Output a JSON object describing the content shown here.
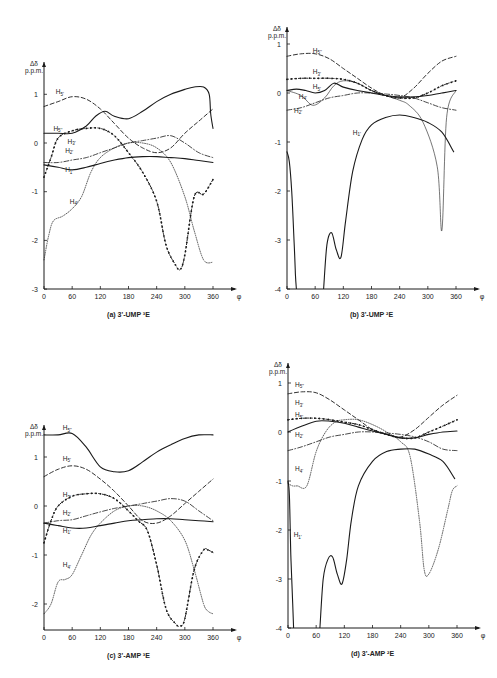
{
  "chart_data": [
    {
      "panel": "a",
      "type": "line",
      "caption": "(a)  3'-UMP ³E",
      "ylabel": "Δδ p.p.m.",
      "xlabel": "φ",
      "xlim": [
        0,
        360
      ],
      "ylim": [
        -3,
        1.3
      ],
      "xticks": [
        0,
        60,
        120,
        180,
        240,
        300,
        360
      ],
      "yticks": [
        1,
        0,
        -1,
        -2,
        -3
      ],
      "series": [
        {
          "name": "H5''",
          "style": "solid",
          "x": [
            0,
            30,
            60,
            90,
            110,
            130,
            150,
            180,
            210,
            240,
            270,
            300,
            320,
            340,
            352,
            355,
            360
          ],
          "y": [
            0.2,
            0.2,
            0.2,
            0.35,
            0.55,
            0.65,
            0.55,
            0.5,
            0.65,
            0.85,
            1.0,
            1.1,
            1.15,
            1.15,
            1.0,
            0.6,
            0.3
          ]
        },
        {
          "name": "H5'",
          "style": "dashed",
          "x": [
            0,
            30,
            60,
            90,
            120,
            150,
            180,
            210,
            240,
            270,
            300,
            330,
            360
          ],
          "y": [
            0.75,
            0.85,
            0.95,
            0.9,
            0.7,
            0.4,
            0.1,
            -0.1,
            -0.2,
            -0.1,
            0.2,
            0.45,
            0.7
          ]
        },
        {
          "name": "H3'",
          "style": "dotted-cross",
          "x": [
            0,
            15,
            30,
            60,
            90,
            120,
            150,
            180,
            210,
            240,
            260,
            280,
            290,
            300,
            320,
            340,
            360
          ],
          "y": [
            -0.7,
            -0.3,
            0.1,
            0.25,
            0.3,
            0.3,
            0.15,
            -0.2,
            -0.6,
            -1.2,
            -2.1,
            -2.5,
            -2.6,
            -2.3,
            -1.1,
            -1.05,
            -0.75
          ]
        },
        {
          "name": "H2'",
          "style": "dash-dot",
          "x": [
            0,
            30,
            60,
            90,
            120,
            150,
            180,
            210,
            240,
            270,
            300,
            330,
            360
          ],
          "y": [
            -0.4,
            -0.4,
            -0.35,
            -0.3,
            -0.2,
            -0.1,
            0.0,
            0.05,
            0.1,
            0.15,
            0.0,
            -0.2,
            -0.3
          ]
        },
        {
          "name": "H1'",
          "style": "solid",
          "x": [
            0,
            30,
            60,
            90,
            120,
            150,
            180,
            210,
            240,
            270,
            300,
            330,
            360
          ],
          "y": [
            -0.45,
            -0.5,
            -0.55,
            -0.5,
            -0.42,
            -0.35,
            -0.3,
            -0.28,
            -0.28,
            -0.3,
            -0.32,
            -0.36,
            -0.4
          ]
        },
        {
          "name": "H4'",
          "style": "dotted",
          "x": [
            0,
            10,
            20,
            40,
            60,
            80,
            100,
            120,
            150,
            180,
            210,
            240,
            270,
            300,
            320,
            340,
            360
          ],
          "y": [
            -2.4,
            -1.9,
            -1.6,
            -1.5,
            -1.35,
            -1.1,
            -0.6,
            -0.3,
            -0.1,
            0.0,
            0.0,
            -0.1,
            -0.4,
            -1.1,
            -1.8,
            -2.4,
            -2.45
          ]
        }
      ]
    },
    {
      "panel": "b",
      "type": "line",
      "caption": "(b)  3'-UMP ²E",
      "ylabel": "Δδ p.p.m.",
      "xlabel": "φ",
      "xlim": [
        0,
        360
      ],
      "ylim": [
        -4,
        1.3
      ],
      "xticks": [
        0,
        60,
        120,
        180,
        240,
        300,
        360
      ],
      "yticks": [
        1,
        0,
        -1,
        -2,
        -3,
        -4
      ],
      "series": [
        {
          "name": "H5''",
          "style": "dashed",
          "x": [
            0,
            30,
            60,
            90,
            120,
            150,
            180,
            210,
            240,
            270,
            300,
            330,
            360
          ],
          "y": [
            0.75,
            0.8,
            0.8,
            0.7,
            0.5,
            0.3,
            0.1,
            -0.05,
            -0.1,
            0.1,
            0.4,
            0.65,
            0.75
          ]
        },
        {
          "name": "H3'",
          "style": "dotted-cross",
          "x": [
            0,
            30,
            60,
            90,
            120,
            150,
            180,
            210,
            240,
            270,
            300,
            330,
            360
          ],
          "y": [
            0.28,
            0.3,
            0.3,
            0.3,
            0.28,
            0.2,
            0.05,
            -0.05,
            -0.1,
            -0.1,
            0.0,
            0.15,
            0.25
          ]
        },
        {
          "name": "H5'",
          "style": "solid",
          "x": [
            0,
            20,
            40,
            60,
            80,
            100,
            120,
            150,
            180,
            210,
            240,
            270,
            300,
            330,
            360
          ],
          "y": [
            0.05,
            0.08,
            0.05,
            0.0,
            0.05,
            0.2,
            0.12,
            0.05,
            0.0,
            -0.05,
            -0.08,
            -0.08,
            -0.05,
            0.0,
            0.05
          ]
        },
        {
          "name": "H4'",
          "style": "solid-thin",
          "x": [
            0,
            30,
            55,
            80,
            100,
            120,
            150,
            180,
            210,
            240,
            260,
            290,
            320,
            330,
            340,
            360
          ],
          "y": [
            0.05,
            -0.05,
            -0.25,
            -0.1,
            0.15,
            0.25,
            0.2,
            0.05,
            -0.05,
            -0.15,
            -0.25,
            -0.6,
            -1.5,
            -2.8,
            -0.5,
            0.05
          ]
        },
        {
          "name": "H2'",
          "style": "dash-dot",
          "x": [
            0,
            30,
            60,
            90,
            120,
            150,
            180,
            210,
            240,
            270,
            300,
            330,
            360
          ],
          "y": [
            -0.35,
            -0.3,
            -0.2,
            -0.1,
            -0.05,
            0.0,
            0.0,
            -0.02,
            -0.05,
            -0.1,
            -0.2,
            -0.3,
            -0.35
          ]
        },
        {
          "name": "H1'",
          "style": "solid",
          "x": [
            0,
            5,
            10,
            15,
            18,
            20
          ],
          "y": [
            -1.2,
            -1.4,
            -2.0,
            -3.0,
            -3.7,
            -4.0
          ]
        },
        {
          "name": "H1' (cont.)",
          "style": "solid",
          "x": [
            78,
            85,
            95,
            105,
            115,
            125,
            140,
            160,
            180,
            210,
            240,
            270,
            300,
            330,
            355
          ],
          "y": [
            -4.0,
            -3.1,
            -2.85,
            -3.2,
            -3.35,
            -2.6,
            -1.6,
            -0.95,
            -0.65,
            -0.5,
            -0.45,
            -0.5,
            -0.6,
            -0.8,
            -1.2
          ]
        }
      ]
    },
    {
      "panel": "c",
      "type": "line",
      "caption": "(c)  3'-AMP ³E",
      "ylabel": "Δδ p.p.m.",
      "xlabel": "φ",
      "xlim": [
        0,
        360
      ],
      "ylim": [
        -2.5,
        1.6
      ],
      "xticks": [
        0,
        60,
        120,
        180,
        240,
        300,
        360
      ],
      "yticks": [
        1,
        0,
        -1,
        -2
      ],
      "series": [
        {
          "name": "H5''",
          "style": "solid",
          "x": [
            0,
            30,
            60,
            90,
            120,
            150,
            180,
            210,
            240,
            270,
            300,
            330,
            360
          ],
          "y": [
            1.45,
            1.45,
            1.48,
            1.2,
            0.8,
            0.7,
            0.72,
            0.9,
            1.1,
            1.25,
            1.38,
            1.45,
            1.45
          ]
        },
        {
          "name": "H5'",
          "style": "dashed",
          "x": [
            0,
            30,
            60,
            90,
            120,
            150,
            180,
            210,
            240,
            270,
            300,
            330,
            360
          ],
          "y": [
            0.6,
            0.75,
            0.82,
            0.75,
            0.55,
            0.3,
            0.0,
            -0.3,
            -0.35,
            -0.2,
            0.05,
            0.3,
            0.55
          ]
        },
        {
          "name": "H3'",
          "style": "dotted-cross",
          "x": [
            0,
            15,
            30,
            60,
            90,
            120,
            150,
            180,
            200,
            220,
            240,
            260,
            280,
            290,
            300,
            320,
            340,
            350,
            360
          ],
          "y": [
            -0.75,
            -0.3,
            0.0,
            0.2,
            0.25,
            0.25,
            0.15,
            -0.1,
            -0.3,
            -0.5,
            -1.2,
            -2.1,
            -2.4,
            -2.45,
            -2.3,
            -1.3,
            -0.9,
            -0.9,
            -0.95
          ]
        },
        {
          "name": "H2'",
          "style": "dash-dot",
          "x": [
            0,
            30,
            60,
            90,
            120,
            150,
            180,
            210,
            240,
            270,
            300,
            330,
            360
          ],
          "y": [
            -0.35,
            -0.3,
            -0.28,
            -0.2,
            -0.12,
            -0.05,
            0.0,
            0.05,
            0.1,
            0.15,
            0.1,
            -0.1,
            -0.3
          ]
        },
        {
          "name": "H1'",
          "style": "solid",
          "x": [
            0,
            30,
            60,
            90,
            120,
            150,
            180,
            210,
            240,
            270,
            300,
            330,
            360
          ],
          "y": [
            -0.35,
            -0.4,
            -0.45,
            -0.45,
            -0.4,
            -0.35,
            -0.3,
            -0.28,
            -0.26,
            -0.26,
            -0.28,
            -0.3,
            -0.32
          ]
        },
        {
          "name": "H4'",
          "style": "dotted",
          "x": [
            0,
            15,
            30,
            45,
            60,
            80,
            100,
            120,
            150,
            180,
            210,
            240,
            270,
            300,
            320,
            340,
            350,
            360
          ],
          "y": [
            -2.2,
            -2.0,
            -1.55,
            -1.5,
            -1.4,
            -1.0,
            -0.6,
            -0.35,
            -0.1,
            0.0,
            0.0,
            -0.1,
            -0.3,
            -0.7,
            -1.3,
            -2.0,
            -2.15,
            -2.2
          ]
        }
      ]
    },
    {
      "panel": "d",
      "type": "line",
      "caption": "(d)  3'-AMP ²E",
      "ylabel": "Δδ p.p.m.",
      "xlabel": "φ",
      "xlim": [
        0,
        360
      ],
      "ylim": [
        -4,
        1.3
      ],
      "xticks": [
        0,
        60,
        120,
        180,
        240,
        300,
        360
      ],
      "yticks": [
        1,
        0,
        -1,
        -2,
        -3,
        -4
      ],
      "series": [
        {
          "name": "H5''",
          "style": "dashed",
          "x": [
            0,
            30,
            60,
            90,
            120,
            150,
            180,
            210,
            240,
            270,
            300,
            330,
            360
          ],
          "y": [
            0.78,
            0.82,
            0.8,
            0.65,
            0.45,
            0.25,
            0.05,
            -0.05,
            -0.1,
            0.05,
            0.3,
            0.55,
            0.75
          ]
        },
        {
          "name": "H3'",
          "style": "dotted-cross",
          "x": [
            0,
            30,
            60,
            90,
            120,
            150,
            180,
            210,
            240,
            270,
            300,
            330,
            360
          ],
          "y": [
            0.25,
            0.28,
            0.28,
            0.25,
            0.2,
            0.15,
            0.05,
            -0.05,
            -0.12,
            -0.12,
            0.0,
            0.12,
            0.25
          ]
        },
        {
          "name": "H5'",
          "style": "solid",
          "x": [
            0,
            30,
            60,
            90,
            120,
            150,
            180,
            210,
            240,
            270,
            300,
            330,
            360
          ],
          "y": [
            0.0,
            0.12,
            0.22,
            0.22,
            0.18,
            0.1,
            0.02,
            -0.05,
            -0.12,
            -0.12,
            -0.05,
            0.0,
            0.02
          ]
        },
        {
          "name": "H2'",
          "style": "dash-dot",
          "x": [
            0,
            30,
            60,
            90,
            120,
            150,
            180,
            210,
            240,
            270,
            300,
            330,
            360
          ],
          "y": [
            -0.38,
            -0.3,
            -0.2,
            -0.1,
            -0.05,
            0.0,
            0.0,
            -0.02,
            -0.05,
            -0.1,
            -0.2,
            -0.35,
            -0.38
          ]
        },
        {
          "name": "H4'",
          "style": "dotted",
          "x": [
            0,
            10,
            20,
            40,
            60,
            80,
            100,
            120,
            150,
            180,
            210,
            240,
            260,
            280,
            290,
            300,
            320,
            340,
            350,
            360
          ],
          "y": [
            -1.05,
            -1.1,
            -1.1,
            -1.1,
            -0.4,
            0.0,
            0.2,
            0.25,
            0.25,
            0.15,
            0.0,
            -0.2,
            -0.5,
            -1.8,
            -2.8,
            -2.9,
            -2.4,
            -1.6,
            -1.2,
            -1.1
          ]
        },
        {
          "name": "H1'",
          "style": "solid",
          "x": [
            0,
            3,
            6,
            10,
            12
          ],
          "y": [
            -1.0,
            -1.3,
            -2.5,
            -3.5,
            -4.0
          ]
        },
        {
          "name": "H1' (cont.)",
          "style": "solid",
          "x": [
            68,
            75,
            85,
            95,
            105,
            115,
            125,
            135,
            150,
            180,
            210,
            240,
            270,
            300,
            330,
            355
          ],
          "y": [
            -4.0,
            -3.0,
            -2.6,
            -2.55,
            -2.9,
            -3.1,
            -2.6,
            -1.8,
            -1.1,
            -0.6,
            -0.4,
            -0.35,
            -0.35,
            -0.45,
            -0.6,
            -0.95
          ]
        }
      ]
    }
  ],
  "panels": {
    "a": {
      "caption": "(a)   3'-UMP ³E",
      "ylabel_top": "Δδ",
      "ylabel_bottom": "p.p.m.",
      "xlabel": "φ",
      "series_labels": [
        "H5''",
        "H5'",
        "H3'",
        "H2'",
        "H1'",
        "H4'"
      ]
    },
    "b": {
      "caption": "(b)   3'-UMP ²E",
      "ylabel_top": "Δδ",
      "ylabel_bottom": "p.p.m.",
      "xlabel": "φ",
      "series_labels": [
        "H5''",
        "H3'",
        "H5'",
        "H4'",
        "H2'",
        "H1'"
      ]
    },
    "c": {
      "caption": "(c)   3'-AMP ³E",
      "ylabel_top": "Δδ",
      "ylabel_bottom": "p.p.m.",
      "xlabel": "φ",
      "series_labels": [
        "H5''",
        "H5'",
        "H3'",
        "H2'",
        "H1'",
        "H4'"
      ]
    },
    "d": {
      "caption": "(d)   3'-AMP ²E",
      "ylabel_top": "Δδ",
      "ylabel_bottom": "p.p.m.",
      "xlabel": "φ",
      "series_labels": [
        "H5''",
        "H3'",
        "H5'",
        "H2'",
        "H4'",
        "H1'"
      ]
    }
  },
  "layout": {
    "ink": "#1a1a1a",
    "background": "#ffffff",
    "frames": {
      "a": {
        "x0": 44,
        "x360": 213,
        "y_zero": 143,
        "px_per_unit": 48.7,
        "y_axis_top": 62,
        "y_axis_bottom": 289
      },
      "b": {
        "x0": 287,
        "x360": 456,
        "y_zero": 93,
        "px_per_unit": 49,
        "y_axis_top": 27,
        "y_axis_bottom": 289
      },
      "c": {
        "x0": 44,
        "x360": 213,
        "y_zero": 506,
        "px_per_unit": 49,
        "y_axis_top": 425,
        "y_axis_bottom": 630
      },
      "d": {
        "x0": 288,
        "x360": 457,
        "y_zero": 432,
        "px_per_unit": 49,
        "y_axis_top": 363,
        "y_axis_bottom": 628
      }
    }
  }
}
